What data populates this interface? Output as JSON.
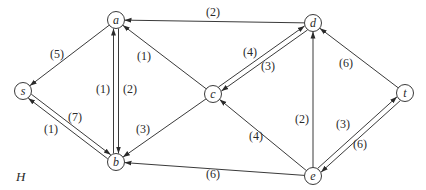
{
  "graph": {
    "name": "H",
    "directed": true,
    "nodes": [
      {
        "id": "a",
        "label": "a",
        "x": 116,
        "y": 20
      },
      {
        "id": "b",
        "label": "b",
        "x": 116,
        "y": 162
      },
      {
        "id": "s",
        "label": "s",
        "x": 23,
        "y": 91
      },
      {
        "id": "c",
        "label": "c",
        "x": 213,
        "y": 94
      },
      {
        "id": "d",
        "label": "d",
        "x": 313,
        "y": 23
      },
      {
        "id": "t",
        "label": "t",
        "x": 405,
        "y": 93
      },
      {
        "id": "e",
        "label": "e",
        "x": 313,
        "y": 176
      }
    ],
    "edges": [
      {
        "from": "d",
        "to": "a",
        "weight": "(2)",
        "offset": 0,
        "lx": 213,
        "ly": 12
      },
      {
        "from": "a",
        "to": "s",
        "weight": "(5)",
        "offset": 0,
        "lx": 57,
        "ly": 54
      },
      {
        "from": "c",
        "to": "a",
        "weight": "(1)",
        "offset": 0,
        "lx": 144,
        "ly": 56
      },
      {
        "from": "a",
        "to": "b",
        "weight": "(1)",
        "offset": -2.5,
        "lx": 103,
        "ly": 89
      },
      {
        "from": "b",
        "to": "a",
        "weight": "(2)",
        "offset": -2.5,
        "lx": 130,
        "ly": 89
      },
      {
        "from": "d",
        "to": "c",
        "weight": "(4)",
        "offset": -2.5,
        "lx": 250,
        "ly": 52
      },
      {
        "from": "c",
        "to": "d",
        "weight": "(3)",
        "offset": -2.5,
        "lx": 268,
        "ly": 66
      },
      {
        "from": "t",
        "to": "d",
        "weight": "(6)",
        "offset": 0,
        "lx": 346,
        "ly": 63
      },
      {
        "from": "e",
        "to": "d",
        "weight": "(2)",
        "offset": 0,
        "lx": 302,
        "ly": 119
      },
      {
        "from": "e",
        "to": "c",
        "weight": "(4)",
        "offset": 0,
        "lx": 256,
        "ly": 136
      },
      {
        "from": "c",
        "to": "b",
        "weight": "(3)",
        "offset": 0,
        "lx": 143,
        "ly": 129
      },
      {
        "from": "b",
        "to": "s",
        "weight": "(7)",
        "offset": -2.5,
        "lx": 75,
        "ly": 117
      },
      {
        "from": "s",
        "to": "b",
        "weight": "(1)",
        "offset": -2.5,
        "lx": 51,
        "ly": 129
      },
      {
        "from": "e",
        "to": "b",
        "weight": "(6)",
        "offset": 0,
        "lx": 213,
        "ly": 174
      },
      {
        "from": "e",
        "to": "t",
        "weight": "(3)",
        "offset": -2.5,
        "lx": 343,
        "ly": 124
      },
      {
        "from": "t",
        "to": "e",
        "weight": "(6)",
        "offset": -2.5,
        "lx": 360,
        "ly": 144
      }
    ]
  },
  "labels": {
    "graph_name": "H"
  }
}
